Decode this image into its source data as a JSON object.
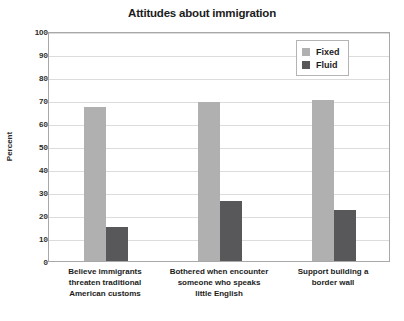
{
  "chart_data": {
    "type": "bar",
    "title": "Attitudes about immigration",
    "xlabel": "",
    "ylabel": "Percent",
    "ylim": [
      0,
      100
    ],
    "ytick_step": 10,
    "yticks": [
      0,
      10,
      20,
      30,
      40,
      50,
      60,
      70,
      80,
      90,
      100
    ],
    "ytick_labels": [
      "0",
      "10",
      "20",
      "30",
      "40",
      "50",
      "60",
      "70",
      "80",
      "90",
      "100"
    ],
    "grid": true,
    "legend_position": "top-right",
    "categories": [
      "Believe immigrants threaten traditional American customs",
      "Bothered when encounter someone who speaks little English",
      "Support building a border wall"
    ],
    "category_lines": [
      [
        "Believe immigrants",
        "threaten traditional",
        "American customs"
      ],
      [
        "Bothered when encounter",
        "someone who speaks",
        "little English"
      ],
      [
        "Support building a",
        "border wall"
      ]
    ],
    "series": [
      {
        "name": "Fixed",
        "color": "#b0b0b0",
        "values": [
          67,
          69,
          70
        ]
      },
      {
        "name": "Fluid",
        "color": "#58585a",
        "values": [
          15,
          26,
          22
        ]
      }
    ]
  },
  "legend": {
    "items": [
      {
        "label": "Fixed",
        "color": "#b0b0b0"
      },
      {
        "label": "Fluid",
        "color": "#58585a"
      }
    ]
  },
  "axis": {
    "y_title": "Percent"
  }
}
